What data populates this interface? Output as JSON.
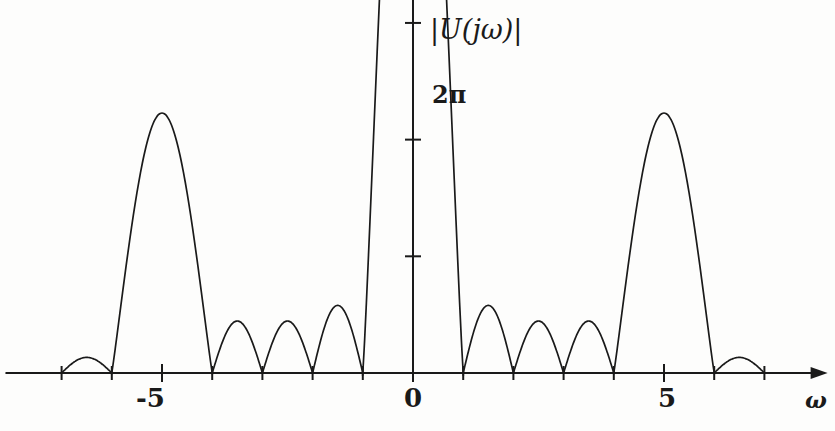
{
  "figure": {
    "background": "#fdfdfc",
    "ink": "#1a1a1a"
  },
  "axes": {
    "y_axis_title": "|U(jω)|",
    "x_axis_title": "ω",
    "y_peak_label": "2π",
    "x_tick_labels": [
      "-5",
      "0",
      "5"
    ],
    "x_labeled_values": [
      -5,
      0,
      5
    ],
    "x_tick_values": [
      -7,
      -6,
      -5,
      -4,
      -3,
      -2,
      -1,
      0,
      1,
      2,
      3,
      4,
      5,
      6,
      7
    ],
    "y_tick_count": 8,
    "origin_px": {
      "x": 413,
      "y": 373
    },
    "px_per_unit_x": 50.2,
    "px_per_unit_y": 130.0
  },
  "chart_data": {
    "type": "line",
    "title": "|U(jω)|",
    "xlabel": "ω",
    "ylabel": "|U(jω)|",
    "xlim": [
      -8.1,
      8.1
    ],
    "ylim": [
      0,
      7.4
    ],
    "grid": false,
    "legend": null,
    "annotations": [
      {
        "text": "2π",
        "x": 0.0,
        "y": 6.2832,
        "note": "peak value of main lobe"
      }
    ],
    "series": [
      {
        "name": "|U(jω)|",
        "color": "#1a1a1a",
        "description": "Magnitude of Fourier transform: periodic-pulse-like spectrum with nulls at integer ω, a tall main lobe of height 2π at ω=0, large secondary lobes of height ≈2.0 at ω=±5, mid lobes ≈0.40 at ω=±1.5 and ±2.5, ≈0.52 at ω=±3.5, and small end lobes ≈0.12 at ω=±6.5",
        "lobes": [
          {
            "center": -6.5,
            "left": -7.0,
            "right": -6.0,
            "peak": 0.12
          },
          {
            "center": -5.0,
            "left": -6.0,
            "right": -4.0,
            "peak": 2.0
          },
          {
            "center": -3.5,
            "left": -4.0,
            "right": -3.0,
            "peak": 0.4
          },
          {
            "center": -2.5,
            "left": -3.0,
            "right": -2.0,
            "peak": 0.4
          },
          {
            "center": -1.5,
            "left": -2.0,
            "right": -1.0,
            "peak": 0.52
          },
          {
            "center": 0.0,
            "left": -1.0,
            "right": 1.0,
            "peak": 6.2832
          },
          {
            "center": 1.5,
            "left": 1.0,
            "right": 2.0,
            "peak": 0.52
          },
          {
            "center": 2.5,
            "left": 2.0,
            "right": 3.0,
            "peak": 0.4
          },
          {
            "center": 3.5,
            "left": 3.0,
            "right": 4.0,
            "peak": 0.4
          },
          {
            "center": 5.0,
            "left": 4.0,
            "right": 6.0,
            "peak": 2.0
          },
          {
            "center": 6.5,
            "left": 6.0,
            "right": 7.0,
            "peak": 0.12
          }
        ]
      }
    ]
  }
}
